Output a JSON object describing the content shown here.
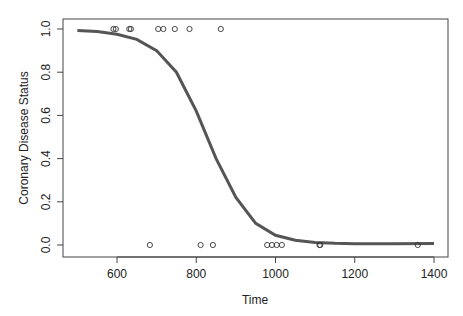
{
  "chart_data": {
    "type": "scatter",
    "title": "",
    "xlabel": "Time",
    "ylabel": "Coronary Disease Status",
    "xlim": [
      500,
      1400
    ],
    "ylim": [
      0,
      1
    ],
    "x_ticks": [
      "600",
      "800",
      "1000",
      "1200",
      "1400"
    ],
    "y_ticks": [
      "0.0",
      "0.2",
      "0.4",
      "0.6",
      "0.8",
      "1.0"
    ],
    "grid": false,
    "legend": null,
    "series": [
      {
        "name": "observed",
        "kind": "points",
        "marker": "open-circle",
        "points": [
          [
            591,
            1
          ],
          [
            597,
            1
          ],
          [
            631,
            1
          ],
          [
            635,
            1
          ],
          [
            704,
            1
          ],
          [
            717,
            1
          ],
          [
            746,
            1
          ],
          [
            783,
            1
          ],
          [
            862,
            1
          ],
          [
            683,
            0
          ],
          [
            811,
            0
          ],
          [
            842,
            0
          ],
          [
            979,
            0
          ],
          [
            991,
            0
          ],
          [
            1003,
            0
          ],
          [
            1016,
            0
          ],
          [
            1111,
            0
          ],
          [
            1113,
            0
          ],
          [
            1359,
            0
          ]
        ]
      },
      {
        "name": "fitted logistic curve",
        "kind": "line",
        "color": "#555555",
        "points": [
          [
            500,
            0.993
          ],
          [
            550,
            0.988
          ],
          [
            600,
            0.976
          ],
          [
            650,
            0.952
          ],
          [
            700,
            0.9
          ],
          [
            750,
            0.8
          ],
          [
            800,
            0.62
          ],
          [
            825,
            0.51
          ],
          [
            850,
            0.4
          ],
          [
            900,
            0.22
          ],
          [
            950,
            0.1
          ],
          [
            1000,
            0.045
          ],
          [
            1050,
            0.022
          ],
          [
            1100,
            0.012
          ],
          [
            1150,
            0.008
          ],
          [
            1200,
            0.006
          ],
          [
            1300,
            0.006
          ],
          [
            1400,
            0.007
          ]
        ]
      }
    ]
  }
}
